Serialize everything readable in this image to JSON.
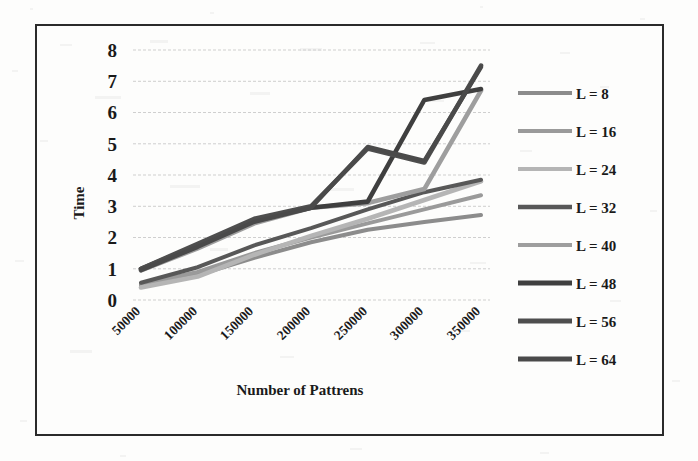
{
  "figure": {
    "y_axis_title": "Time",
    "x_axis_title": "Number of Pattrens"
  },
  "legend": {
    "position": "right",
    "items": [
      {
        "label": "L = 8",
        "color": "#8c8c8c"
      },
      {
        "label": "L = 16",
        "color": "#9a9a9a"
      },
      {
        "label": "L = 24",
        "color": "#b5b5b5"
      },
      {
        "label": "L = 32",
        "color": "#585858"
      },
      {
        "label": "L = 40",
        "color": "#9e9e9e"
      },
      {
        "label": "L = 48",
        "color": "#3f3f3f"
      },
      {
        "label": "L = 56",
        "color": "#4e4e4e"
      },
      {
        "label": "L = 64",
        "color": "#4a4a4a"
      }
    ]
  },
  "chart_data": {
    "type": "line",
    "title": "",
    "xlabel": "Number of Pattrens",
    "ylabel": "Time",
    "categories": [
      "50000",
      "100000",
      "150000",
      "200000",
      "250000",
      "300000",
      "350000"
    ],
    "x": [
      50000,
      100000,
      150000,
      200000,
      250000,
      300000,
      350000
    ],
    "ylim": [
      0,
      8
    ],
    "yticks": [
      0,
      1,
      2,
      3,
      4,
      5,
      6,
      7,
      8
    ],
    "grid": true,
    "legend_position": "right",
    "series": [
      {
        "name": "L = 8",
        "color": "#8c8c8c",
        "values": [
          0.45,
          0.8,
          1.35,
          1.85,
          2.25,
          2.5,
          2.72
        ]
      },
      {
        "name": "L = 16",
        "color": "#9a9a9a",
        "values": [
          0.5,
          0.9,
          1.5,
          2.0,
          2.45,
          2.9,
          3.35
        ]
      },
      {
        "name": "L = 24",
        "color": "#b5b5b5",
        "values": [
          0.4,
          0.75,
          1.45,
          2.05,
          2.6,
          3.2,
          3.8
        ]
      },
      {
        "name": "L = 32",
        "color": "#585858",
        "values": [
          0.55,
          1.05,
          1.75,
          2.3,
          2.9,
          3.45,
          3.85
        ]
      },
      {
        "name": "L = 40",
        "color": "#9e9e9e",
        "values": [
          0.95,
          1.65,
          2.45,
          2.95,
          3.1,
          3.55,
          6.7
        ]
      },
      {
        "name": "L = 48",
        "color": "#3f3f3f",
        "values": [
          1.0,
          1.75,
          2.55,
          2.95,
          3.15,
          6.4,
          6.75
        ]
      },
      {
        "name": "L = 56",
        "color": "#4e4e4e",
        "values": [
          1.0,
          1.8,
          2.6,
          3.0,
          4.85,
          4.4,
          7.5
        ]
      },
      {
        "name": "L = 64",
        "color": "#4a4a4a",
        "values": [
          0.95,
          1.7,
          2.5,
          2.95,
          4.9,
          4.45,
          7.45
        ]
      }
    ]
  }
}
